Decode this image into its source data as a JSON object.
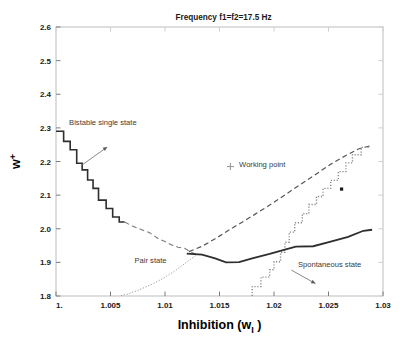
{
  "chart_data": {
    "type": "line",
    "title": "Frequency  f1=f2=17.5  Hz",
    "xlabel_main": "Inhibition",
    "xlabel_paren_open": "(w",
    "xlabel_sub": "I",
    "xlabel_paren_close": ")",
    "ylabel_main": "w",
    "ylabel_sup": "+",
    "xlim": [
      1.0,
      1.03
    ],
    "ylim": [
      1.8,
      2.6
    ],
    "grid": false,
    "legend": "none",
    "xticks": [
      1.0,
      1.005,
      1.01,
      1.015,
      1.02,
      1.025,
      1.03
    ],
    "xticklabels": [
      "1.",
      "1.005",
      "1.01",
      "1.015",
      "1.02",
      "1.025",
      "1.03"
    ],
    "yticks": [
      1.8,
      1.9,
      2.0,
      2.1,
      2.2,
      2.3,
      2.4,
      2.5,
      2.6
    ],
    "yticklabels": [
      "1.8",
      "1.9",
      "2.0",
      "2.1",
      "2.2",
      "2.3",
      "2.4",
      "2.5",
      "2.6"
    ],
    "series": [
      {
        "name": "bistable-boundary-staircase",
        "style": "solid",
        "color": "#2e2e2e",
        "width": 1.6,
        "points": [
          [
            1.0,
            2.29
          ],
          [
            1.0007,
            2.29
          ],
          [
            1.0007,
            2.26
          ],
          [
            1.0013,
            2.26
          ],
          [
            1.0013,
            2.235
          ],
          [
            1.0019,
            2.235
          ],
          [
            1.0019,
            2.195
          ],
          [
            1.0024,
            2.195
          ],
          [
            1.0024,
            2.175
          ],
          [
            1.0029,
            2.175
          ],
          [
            1.0029,
            2.145
          ],
          [
            1.0034,
            2.145
          ],
          [
            1.0034,
            2.12
          ],
          [
            1.0039,
            2.12
          ],
          [
            1.0039,
            2.085
          ],
          [
            1.0046,
            2.085
          ],
          [
            1.0046,
            2.06
          ],
          [
            1.0052,
            2.06
          ],
          [
            1.0052,
            2.035
          ],
          [
            1.0058,
            2.035
          ],
          [
            1.0058,
            2.02
          ],
          [
            1.0063,
            2.02
          ]
        ]
      },
      {
        "name": "pair-state-boundary-dashed",
        "style": "dashed",
        "color": "#7a7a7a",
        "width": 1.1,
        "points": [
          [
            1.0063,
            2.02
          ],
          [
            1.007,
            2.008
          ],
          [
            1.0078,
            1.998
          ],
          [
            1.0086,
            1.988
          ],
          [
            1.0094,
            1.97
          ],
          [
            1.01,
            1.962
          ],
          [
            1.0106,
            1.952
          ],
          [
            1.0112,
            1.945
          ],
          [
            1.0118,
            1.942
          ],
          [
            1.0124,
            1.93
          ],
          [
            1.013,
            1.922
          ]
        ]
      },
      {
        "name": "pair-state-lower-dotted",
        "style": "dotted",
        "color": "#9a9a9a",
        "width": 1.0,
        "points": [
          [
            1.0128,
            1.92
          ],
          [
            1.0118,
            1.896
          ],
          [
            1.0108,
            1.872
          ],
          [
            1.0098,
            1.852
          ],
          [
            1.0088,
            1.835
          ],
          [
            1.0076,
            1.818
          ],
          [
            1.0066,
            1.806
          ],
          [
            1.0058,
            1.8
          ]
        ]
      },
      {
        "name": "spontaneous-upper-dashed",
        "style": "dashed",
        "color": "#555555",
        "width": 1.2,
        "points": [
          [
            1.0122,
            1.932
          ],
          [
            1.0134,
            1.948
          ],
          [
            1.0146,
            1.97
          ],
          [
            1.0158,
            1.995
          ],
          [
            1.017,
            2.018
          ],
          [
            1.0182,
            2.042
          ],
          [
            1.0194,
            2.066
          ],
          [
            1.0206,
            2.092
          ],
          [
            1.0218,
            2.118
          ],
          [
            1.023,
            2.144
          ],
          [
            1.0242,
            2.17
          ],
          [
            1.0254,
            2.196
          ],
          [
            1.0266,
            2.218
          ],
          [
            1.0278,
            2.238
          ],
          [
            1.029,
            2.248
          ]
        ]
      },
      {
        "name": "spontaneous-state-dotted-staircase",
        "style": "dotted",
        "color": "#8a8a8a",
        "width": 1.4,
        "points": [
          [
            1.018,
            1.8
          ],
          [
            1.018,
            1.828
          ],
          [
            1.0188,
            1.828
          ],
          [
            1.0188,
            1.856
          ],
          [
            1.0196,
            1.856
          ],
          [
            1.0196,
            1.878
          ],
          [
            1.02,
            1.878
          ],
          [
            1.02,
            1.902
          ],
          [
            1.0206,
            1.902
          ],
          [
            1.0206,
            1.93
          ],
          [
            1.021,
            1.93
          ],
          [
            1.021,
            1.96
          ],
          [
            1.0214,
            1.96
          ],
          [
            1.0214,
            1.99
          ],
          [
            1.0219,
            1.99
          ],
          [
            1.0219,
            2.018
          ],
          [
            1.0226,
            2.018
          ],
          [
            1.0226,
            2.045
          ],
          [
            1.0232,
            2.045
          ],
          [
            1.0232,
            2.072
          ],
          [
            1.0239,
            2.072
          ],
          [
            1.0239,
            2.096
          ],
          [
            1.0245,
            2.096
          ],
          [
            1.0245,
            2.12
          ],
          [
            1.0252,
            2.12
          ],
          [
            1.0252,
            2.144
          ],
          [
            1.0259,
            2.144
          ],
          [
            1.0259,
            2.17
          ],
          [
            1.0266,
            2.17
          ],
          [
            1.0266,
            2.196
          ],
          [
            1.0272,
            2.196
          ],
          [
            1.0272,
            2.22
          ],
          [
            1.028,
            2.22
          ],
          [
            1.028,
            2.242
          ],
          [
            1.0288,
            2.242
          ]
        ]
      },
      {
        "name": "lower-solid-boundary",
        "style": "solid",
        "color": "#2e2e2e",
        "width": 1.8,
        "points": [
          [
            1.012,
            1.926
          ],
          [
            1.0134,
            1.923
          ],
          [
            1.0146,
            1.912
          ],
          [
            1.0156,
            1.9
          ],
          [
            1.0168,
            1.901
          ],
          [
            1.018,
            1.912
          ],
          [
            1.0196,
            1.925
          ],
          [
            1.021,
            1.938
          ],
          [
            1.022,
            1.947
          ],
          [
            1.0236,
            1.948
          ],
          [
            1.0252,
            1.962
          ],
          [
            1.0268,
            1.976
          ],
          [
            1.0282,
            1.994
          ],
          [
            1.029,
            1.997
          ]
        ]
      }
    ],
    "markers": [
      {
        "name": "working-point-marker",
        "x": 1.016,
        "y": 2.185,
        "glyph": "plus",
        "color": "#9a9a9a",
        "size": 7
      },
      {
        "name": "square-data-point",
        "x": 1.0262,
        "y": 2.118,
        "glyph": "square",
        "color": "#1a1a1a",
        "size": 3.2
      }
    ],
    "annotations": [
      {
        "name": "bistable-single-state-label",
        "text": "Bistable single state",
        "x": 1.0012,
        "y": 2.308,
        "anchor": "start",
        "arrow": {
          "from_x": 1.0024,
          "from_y": 2.19,
          "to_x": 1.0047,
          "to_y": 2.243
        }
      },
      {
        "name": "working-point-label",
        "text": "Working point",
        "x": 1.0168,
        "y": 2.183,
        "anchor": "start",
        "arrow": null
      },
      {
        "name": "pair-state-label",
        "text": "Pair state",
        "x": 1.0072,
        "y": 1.899,
        "anchor": "start",
        "arrow": null
      },
      {
        "name": "spontaneous-state-label",
        "text": "Spontaneous state",
        "x": 1.0222,
        "y": 1.887,
        "anchor": "start",
        "arrow": {
          "from_x": 1.0216,
          "from_y": 1.877,
          "to_x": 1.0238,
          "to_y": 1.837
        }
      }
    ]
  }
}
